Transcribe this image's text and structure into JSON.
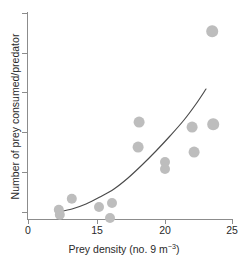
{
  "chart_data": {
    "type": "scatter",
    "title": "",
    "xlabel": "Prey density (no. 9 m−3)",
    "xlabel_parts": {
      "main": "Prey density (no. 9 m",
      "sup": "−3",
      "tail": ")"
    },
    "ylabel": "Number of prey consumed/predator",
    "xlim": [
      0,
      25
    ],
    "ylim": [
      0,
      6
    ],
    "grid": false,
    "legend": null,
    "x_ticks": [
      {
        "value": 0,
        "label": "0",
        "px": 28
      },
      {
        "value": 15,
        "label": "15",
        "px": 97
      },
      {
        "value": 20,
        "label": "20",
        "px": 165
      },
      {
        "value": 25,
        "label": "25",
        "px": 232
      }
    ],
    "y_ticks": [
      {
        "value": 6,
        "label": "",
        "px": 13
      },
      {
        "value": 5,
        "label": "",
        "px": 53
      },
      {
        "value": 4,
        "label": "",
        "px": 92
      },
      {
        "value": 3,
        "label": "",
        "px": 132
      },
      {
        "value": 2,
        "label": "",
        "px": 172
      },
      {
        "value": 1,
        "label": "",
        "px": 212
      }
    ],
    "point_color": "#bdbdbd",
    "curve_color": "#4a4a4a",
    "axis_color": "#8c8c8c",
    "points": [
      {
        "x": 6.0,
        "y": 0.8,
        "px": 59,
        "py": 210,
        "r": 5.2
      },
      {
        "x": 6.0,
        "y": 0.55,
        "px": 60,
        "py": 215,
        "r": 5.2
      },
      {
        "x": 9.0,
        "y": 1.15,
        "px": 72,
        "py": 199,
        "r": 5.2
      },
      {
        "x": 15.0,
        "y": 0.85,
        "px": 99,
        "py": 207,
        "r": 5.0
      },
      {
        "x": 16.0,
        "y": 1.0,
        "px": 112,
        "py": 203,
        "r": 5.0
      },
      {
        "x": 16.0,
        "y": 0.4,
        "px": 110,
        "py": 218,
        "r": 5.0
      },
      {
        "x": 18.0,
        "y": 3.3,
        "px": 139,
        "py": 122,
        "r": 5.4
      },
      {
        "x": 18.0,
        "y": 2.7,
        "px": 138,
        "py": 147,
        "r": 5.4
      },
      {
        "x": 20.0,
        "y": 2.15,
        "px": 165,
        "py": 162,
        "r": 5.0
      },
      {
        "x": 20.0,
        "y": 1.95,
        "px": 165,
        "py": 169,
        "r": 5.0
      },
      {
        "x": 22.0,
        "y": 3.15,
        "px": 192,
        "py": 127,
        "r": 5.4
      },
      {
        "x": 22.0,
        "y": 2.55,
        "px": 194,
        "py": 152,
        "r": 5.4
      },
      {
        "x": 24.0,
        "y": 3.25,
        "px": 213,
        "py": 124,
        "r": 5.8
      },
      {
        "x": 24.0,
        "y": 5.6,
        "px": 212,
        "py": 31,
        "r": 5.8
      }
    ],
    "fit_curve": {
      "description": "exponential increase",
      "path_points": [
        {
          "px": 58,
          "py": 212
        },
        {
          "px": 72,
          "py": 209
        },
        {
          "px": 86,
          "py": 204
        },
        {
          "px": 100,
          "py": 197
        },
        {
          "px": 114,
          "py": 189
        },
        {
          "px": 128,
          "py": 178
        },
        {
          "px": 142,
          "py": 165
        },
        {
          "px": 156,
          "py": 151
        },
        {
          "px": 170,
          "py": 136
        },
        {
          "px": 184,
          "py": 120
        },
        {
          "px": 196,
          "py": 104
        },
        {
          "px": 206,
          "py": 89
        }
      ]
    }
  }
}
